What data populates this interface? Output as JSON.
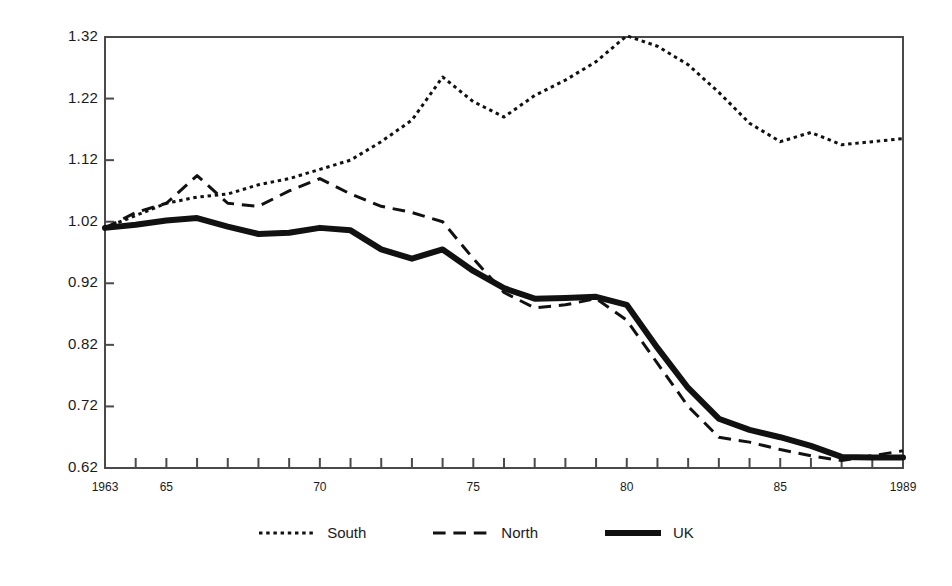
{
  "chart_data": {
    "type": "line",
    "title": "",
    "subtitle": "",
    "xlabel": "",
    "ylabel": "",
    "xlim": [
      1963,
      1989
    ],
    "ylim": [
      0.62,
      1.32
    ],
    "grid": false,
    "legend_position": "bottom",
    "x": [
      1963,
      1964,
      1965,
      1966,
      1967,
      1968,
      1969,
      1970,
      1971,
      1972,
      1973,
      1974,
      1975,
      1976,
      1977,
      1978,
      1979,
      1980,
      1981,
      1982,
      1983,
      1984,
      1985,
      1986,
      1987,
      1988,
      1989
    ],
    "xtick_values": [
      1963,
      1965,
      1970,
      1975,
      1980,
      1985,
      1989
    ],
    "xtick_labels": [
      "1963",
      "65",
      "70",
      "75",
      "80",
      "85",
      "1989"
    ],
    "ytick_values": [
      0.62,
      0.72,
      0.82,
      0.92,
      1.02,
      1.12,
      1.22,
      1.32
    ],
    "ytick_labels": [
      "0.62",
      "0.72",
      "0.82",
      "0.92",
      "1.02",
      "1.12",
      "1.22",
      "1.32"
    ],
    "series": [
      {
        "name": "South",
        "style": "dotted",
        "color": "#111111",
        "width": 3,
        "values": [
          1.01,
          1.03,
          1.05,
          1.06,
          1.065,
          1.08,
          1.09,
          1.105,
          1.12,
          1.15,
          1.185,
          1.255,
          1.215,
          1.19,
          1.225,
          1.25,
          1.28,
          1.322,
          1.305,
          1.275,
          1.23,
          1.18,
          1.15,
          1.165,
          1.145,
          1.15,
          1.155
        ]
      },
      {
        "name": "North",
        "style": "dashed",
        "color": "#111111",
        "width": 3,
        "values": [
          1.01,
          1.035,
          1.05,
          1.095,
          1.05,
          1.045,
          1.07,
          1.09,
          1.065,
          1.045,
          1.035,
          1.02,
          0.96,
          0.905,
          0.88,
          0.885,
          0.895,
          0.86,
          0.79,
          0.72,
          0.67,
          0.662,
          0.65,
          0.64,
          0.632,
          0.64,
          0.648
        ]
      },
      {
        "name": "UK",
        "style": "solid",
        "color": "#111111",
        "width": 6,
        "values": [
          1.01,
          1.015,
          1.022,
          1.026,
          1.012,
          1.0,
          1.002,
          1.01,
          1.006,
          0.975,
          0.96,
          0.975,
          0.94,
          0.912,
          0.895,
          0.896,
          0.898,
          0.885,
          0.815,
          0.75,
          0.7,
          0.682,
          0.67,
          0.656,
          0.638,
          0.637,
          0.637
        ]
      }
    ]
  },
  "axes": {
    "plot_left": 105,
    "plot_right": 903,
    "plot_top": 37,
    "plot_bottom": 468
  },
  "legend": {
    "items": [
      {
        "label": "South",
        "style": "dotted"
      },
      {
        "label": "North",
        "style": "dashed"
      },
      {
        "label": "UK",
        "style": "solid"
      }
    ]
  },
  "colors": {
    "ink": "#111111",
    "axis": "#4a4a4a",
    "background": "#ffffff"
  }
}
